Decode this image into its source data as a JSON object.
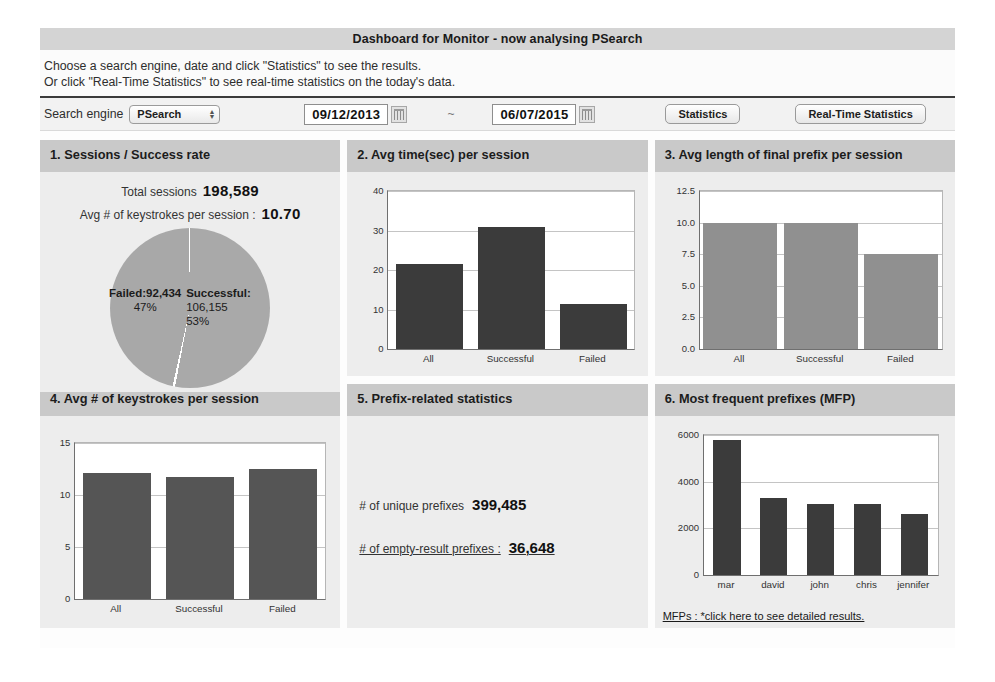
{
  "header": {
    "title": "Dashboard for Monitor - now analysing PSearch",
    "instruction_line1": "Choose a search engine, date and click \"Statistics\" to see the results.",
    "instruction_line2": "Or click \"Real-Time Statistics\" to see real-time statistics on the today's data."
  },
  "controls": {
    "engine_label": "Search engine",
    "engine_value": "PSearch",
    "engine_options": [
      "PSearch"
    ],
    "date_from": "09/12/2013",
    "date_to": "06/07/2015",
    "range_separator": "~",
    "calendar_icon": "calendar-icon",
    "statistics_button": "Statistics",
    "realtime_button": "Real-Time Statistics"
  },
  "panel1": {
    "title": "1. Sessions / Success rate",
    "total_sessions_label": "Total sessions",
    "total_sessions_value": "198,589",
    "avg_keystrokes_label": "Avg # of keystrokes per session :",
    "avg_keystrokes_value": "10.70",
    "failed_label": "Failed:92,434",
    "failed_pct": "47%",
    "successful_label": "Successful:",
    "successful_value": "106,155",
    "successful_pct": "53%"
  },
  "panel2": {
    "title": "2. Avg time(sec) per session"
  },
  "panel3": {
    "title": "3. Avg length of final prefix per session"
  },
  "panel4": {
    "title": "4. Avg # of keystrokes per session"
  },
  "panel5": {
    "title": "5. Prefix-related statistics",
    "unique_label": "# of unique prefixes",
    "unique_value": "399,485",
    "empty_label": "# of empty-result prefixes :",
    "empty_value": "36,648"
  },
  "panel6": {
    "title": "6. Most frequent prefixes (MFP)",
    "footer_link": "MFPs : *click here to see detailed results."
  },
  "colors": {
    "panel_header": "#c9c9c9",
    "panel_body": "#ededed",
    "bar_dark": "#3b3b3b",
    "bar_mid": "#555555",
    "bar_light": "#909090",
    "pie_slice": "#a9a9a9",
    "titlebar": "#d4d4d4"
  },
  "chart_data": [
    {
      "id": "chart2",
      "type": "bar",
      "title": "2. Avg time(sec) per session",
      "categories": [
        "All",
        "Successful",
        "Failed"
      ],
      "values": [
        21.5,
        30.8,
        11.3
      ],
      "yticks": [
        0,
        10,
        20,
        30,
        40
      ],
      "ylim": [
        0,
        40
      ],
      "xlabel": "",
      "ylabel": "",
      "grid": true,
      "legend": "none",
      "bar_color": "#3b3b3b"
    },
    {
      "id": "chart3",
      "type": "bar",
      "title": "3. Avg length of final prefix per session",
      "categories": [
        "All",
        "Successful",
        "Failed"
      ],
      "values": [
        10.0,
        10.0,
        7.5
      ],
      "yticks": [
        0.0,
        2.5,
        5.0,
        7.5,
        10.0,
        12.5
      ],
      "ytick_labels": [
        "0.0",
        "2.5",
        "5.0",
        "7.5",
        "10.0",
        "12.5"
      ],
      "ylim": [
        0,
        12.5
      ],
      "xlabel": "",
      "ylabel": "",
      "grid": true,
      "legend": "none",
      "bar_color": "#909090"
    },
    {
      "id": "chart4",
      "type": "bar",
      "title": "4. Avg # of keystrokes per session",
      "categories": [
        "All",
        "Successful",
        "Failed"
      ],
      "values": [
        12.1,
        11.7,
        12.5
      ],
      "yticks": [
        0,
        5,
        10,
        15
      ],
      "ylim": [
        0,
        15
      ],
      "xlabel": "",
      "ylabel": "",
      "grid": true,
      "legend": "none",
      "bar_color": "#555555"
    },
    {
      "id": "chart6",
      "type": "bar",
      "title": "6. Most frequent prefixes (MFP)",
      "categories": [
        "mar",
        "david",
        "john",
        "chris",
        "jennifer"
      ],
      "values": [
        5800,
        3300,
        3050,
        3030,
        2600
      ],
      "yticks": [
        0,
        2000,
        4000,
        6000
      ],
      "ylim": [
        0,
        6000
      ],
      "xlabel": "",
      "ylabel": "",
      "grid": true,
      "legend": "none",
      "bar_color": "#3b3b3b"
    },
    {
      "id": "chart1",
      "type": "pie",
      "title": "1. Sessions / Success rate",
      "categories": [
        "Failed",
        "Successful"
      ],
      "values": [
        92434,
        106155
      ],
      "percentages": [
        47,
        53
      ],
      "legend": "inline-labels"
    }
  ]
}
